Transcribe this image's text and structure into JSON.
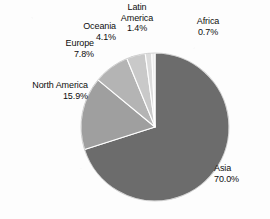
{
  "chart_data": {
    "type": "pie",
    "title": "",
    "subtitle": "",
    "xlabel": "",
    "ylabel": "",
    "legend_position": "none",
    "grid": false,
    "units": "percent",
    "start_angle_deg": 0,
    "direction": "clockwise",
    "categories": [
      "Asia",
      "North America",
      "Europe",
      "Oceania",
      "Latin America",
      "Africa"
    ],
    "values": [
      70.0,
      15.9,
      7.8,
      4.1,
      1.4,
      0.7
    ],
    "slices": [
      {
        "name": "Asia",
        "label": "Asia",
        "value": 70.0,
        "value_label": "70.0%",
        "color": "#6c6c6c",
        "label_align": "left"
      },
      {
        "name": "North America",
        "label": "North America",
        "value": 15.9,
        "value_label": "15.9%",
        "color": "#9f9f9f",
        "label_align": "right"
      },
      {
        "name": "Europe",
        "label": "Europe",
        "value": 7.8,
        "value_label": "7.8%",
        "color": "#b4b4b4",
        "label_align": "right"
      },
      {
        "name": "Oceania",
        "label": "Oceania",
        "value": 4.1,
        "value_label": "4.1%",
        "color": "#c9c9c9",
        "label_align": "right"
      },
      {
        "name": "Latin America",
        "label_line1": "Latin",
        "label_line2": "America",
        "label": "Latin America",
        "value": 1.4,
        "value_label": "1.4%",
        "color": "#dcdcdc",
        "label_align": "center"
      },
      {
        "name": "Africa",
        "label": "Africa",
        "value": 0.7,
        "value_label": "0.7%",
        "color": "#ededed",
        "label_align": "center"
      }
    ],
    "geometry": {
      "center_x": 155,
      "center_y": 127,
      "radius": 74,
      "separator_color": "#ffffff",
      "separator_width": 1.1,
      "outline_color": "#8a8a8a"
    }
  },
  "colors": {
    "background": "#fdfdfd",
    "text": "#0d0d0d"
  }
}
